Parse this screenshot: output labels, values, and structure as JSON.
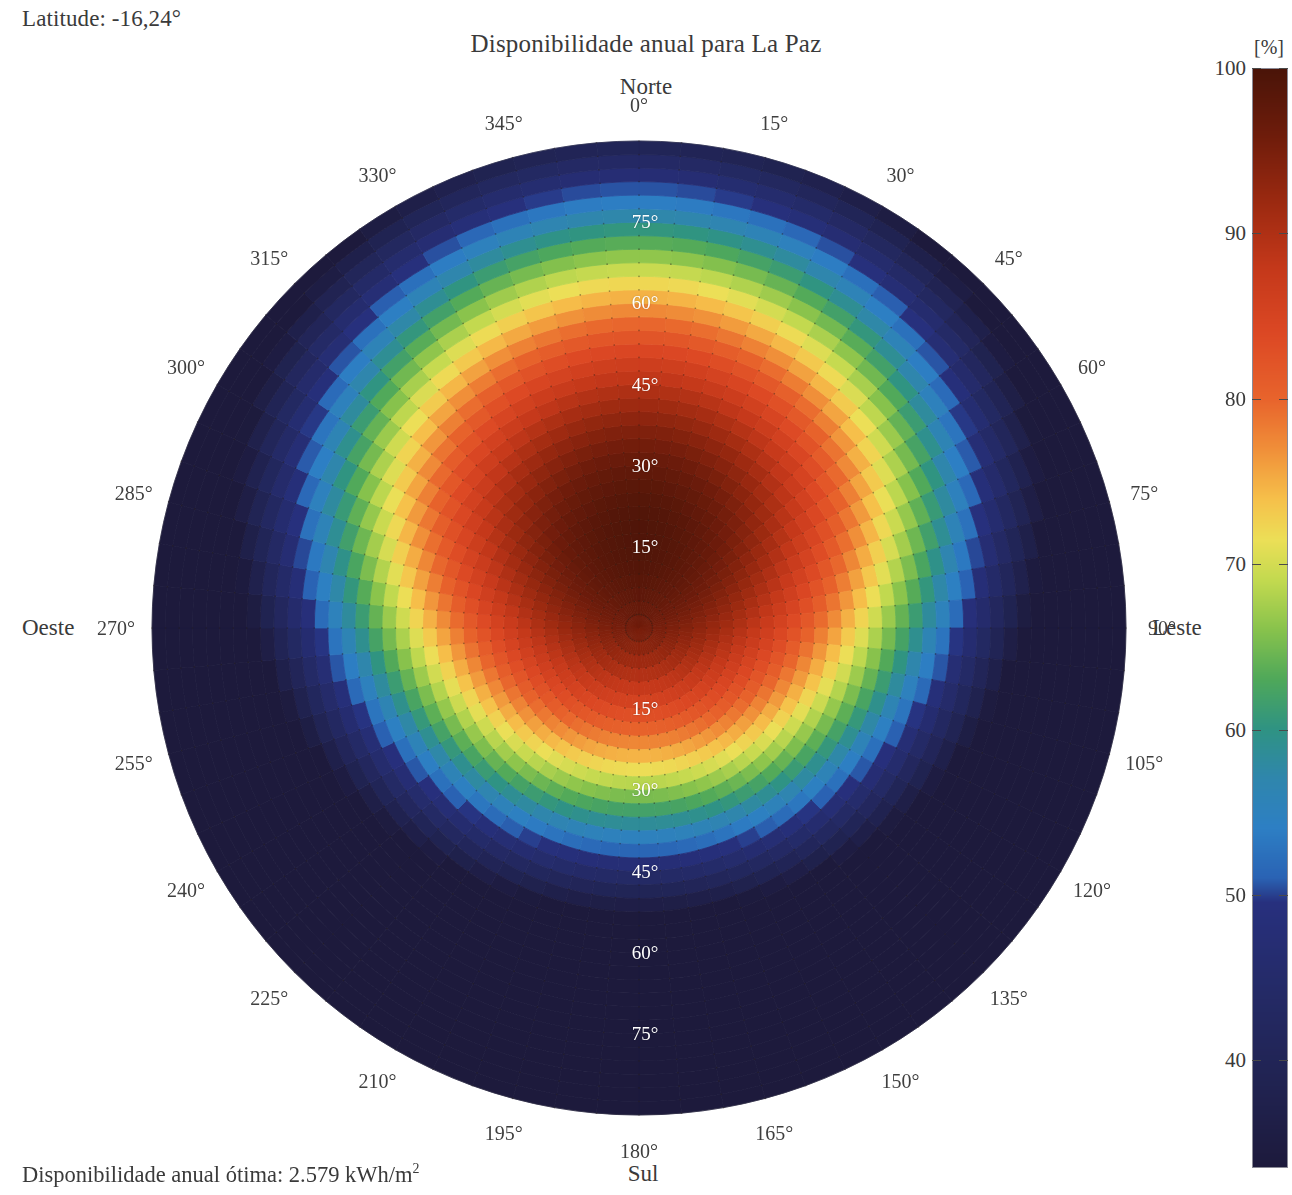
{
  "header": {
    "latitude_label": "Latitude: -16,24°",
    "title": "Disponibilidade anual para La Paz"
  },
  "footer": {
    "note_prefix": "Disponibilidade anual ótima: 2.579 kWh/m",
    "note_exponent": "2"
  },
  "cardinals": {
    "north": "Norte",
    "south": "Sul",
    "west": "Oeste",
    "east": "Leste"
  },
  "colorbar": {
    "unit": "[%]",
    "ticks": [
      100,
      90,
      80,
      70,
      60,
      50,
      40
    ],
    "vmax": 100,
    "vmin": 33.5,
    "stops": [
      {
        "v": 100.0,
        "color": "#4a1408"
      },
      {
        "v": 96.0,
        "color": "#6e1c0b"
      },
      {
        "v": 92.0,
        "color": "#9b2910"
      },
      {
        "v": 88.0,
        "color": "#c4381a"
      },
      {
        "v": 84.0,
        "color": "#dc4824"
      },
      {
        "v": 80.0,
        "color": "#e8642c"
      },
      {
        "v": 77.0,
        "color": "#f08f39"
      },
      {
        "v": 74.0,
        "color": "#f6c04a"
      },
      {
        "v": 71.5,
        "color": "#ecdf57"
      },
      {
        "v": 69.0,
        "color": "#c2d94f"
      },
      {
        "v": 66.0,
        "color": "#87c24c"
      },
      {
        "v": 63.0,
        "color": "#4fa85a"
      },
      {
        "v": 60.0,
        "color": "#2f9383"
      },
      {
        "v": 57.0,
        "color": "#2f86ad"
      },
      {
        "v": 54.0,
        "color": "#2d7fc4"
      },
      {
        "v": 51.0,
        "color": "#2a63b4"
      },
      {
        "v": 49.5,
        "color": "#27307e"
      },
      {
        "v": 44.0,
        "color": "#242a66"
      },
      {
        "v": 38.0,
        "color": "#20224f"
      },
      {
        "v": 33.5,
        "color": "#1d1a3c"
      }
    ]
  },
  "polar": {
    "center_x": 639,
    "center_y": 628,
    "radius": 487,
    "azimuth_labels": [
      "0°",
      "15°",
      "30°",
      "45°",
      "60°",
      "75°",
      "90°",
      "105°",
      "120°",
      "135°",
      "150°",
      "165°",
      "180°",
      "195°",
      "210°",
      "225°",
      "240°",
      "255°",
      "270°",
      "285°",
      "300°",
      "315°",
      "330°",
      "345°"
    ],
    "azimuth_values": [
      0,
      15,
      30,
      45,
      60,
      75,
      90,
      105,
      120,
      135,
      150,
      165,
      180,
      195,
      210,
      225,
      240,
      255,
      270,
      285,
      300,
      315,
      330,
      345
    ],
    "tilt_rings": [
      15,
      30,
      45,
      60,
      75
    ],
    "tilt_labels_north": [
      "15°",
      "30°",
      "45°",
      "60°",
      "75°"
    ],
    "tilt_labels_south": [
      "15°",
      "30°",
      "45°",
      "60°",
      "75°"
    ],
    "tilt_max": 90,
    "n_azimuth_cells": 72,
    "n_tilt_cells": 36
  },
  "chart_data": {
    "type": "heatmap",
    "projection": "polar",
    "title": "Disponibilidade anual para La Paz",
    "subtitle": "Latitude: -16,24°",
    "annotation": "Disponibilidade anual ótima: 2.579 kWh/m2",
    "xlabel": "Azimute [°]  (0° = Norte, 90° = Leste, 180° = Sul, 270° = Oeste)",
    "ylabel": "Inclinação [°]  (0° no centro, 90° na borda)",
    "zlabel": "Disponibilidade anual [%]",
    "zlim": [
      33.5,
      100
    ],
    "grid": true,
    "legend": "colorbar-right",
    "radial_ticks": [
      15,
      30,
      45,
      60,
      75
    ],
    "angular_ticks": [
      0,
      15,
      30,
      45,
      60,
      75,
      90,
      105,
      120,
      135,
      150,
      165,
      180,
      195,
      210,
      225,
      240,
      255,
      270,
      285,
      300,
      315,
      330,
      345
    ],
    "optimum": {
      "azimuth_deg": 0,
      "tilt_deg": 20,
      "value_pct": 100,
      "annual_kwh_per_m2": 2579
    },
    "model": {
      "description": "Availability (%) of the optimum annual irradiation as a function of surface azimuth and tilt; peak 100% around north-facing, tilt ~20 deg (southern hemisphere, latitude -16.24 deg).",
      "peak_tilt_deg": 20,
      "peak_azimuth_deg": 0,
      "value_at_horizontal_pct": 95,
      "value_at_tilt90_north_pct": 58,
      "value_at_tilt90_south_pct": 34,
      "value_at_tilt90_east_west_pct": 52
    },
    "samples": [
      {
        "azimuth_deg": 0,
        "tilt_deg": 0,
        "value_pct": 95.0
      },
      {
        "azimuth_deg": 0,
        "tilt_deg": 15,
        "value_pct": 99.6
      },
      {
        "azimuth_deg": 0,
        "tilt_deg": 20,
        "value_pct": 100.0
      },
      {
        "azimuth_deg": 0,
        "tilt_deg": 30,
        "value_pct": 98.6
      },
      {
        "azimuth_deg": 0,
        "tilt_deg": 45,
        "value_pct": 91.0
      },
      {
        "azimuth_deg": 0,
        "tilt_deg": 60,
        "value_pct": 80.0
      },
      {
        "azimuth_deg": 0,
        "tilt_deg": 75,
        "value_pct": 68.0
      },
      {
        "azimuth_deg": 0,
        "tilt_deg": 90,
        "value_pct": 58.0
      },
      {
        "azimuth_deg": 90,
        "tilt_deg": 15,
        "value_pct": 95.5
      },
      {
        "azimuth_deg": 90,
        "tilt_deg": 30,
        "value_pct": 89.0
      },
      {
        "azimuth_deg": 90,
        "tilt_deg": 45,
        "value_pct": 79.0
      },
      {
        "azimuth_deg": 90,
        "tilt_deg": 60,
        "value_pct": 68.0
      },
      {
        "azimuth_deg": 90,
        "tilt_deg": 75,
        "value_pct": 59.0
      },
      {
        "azimuth_deg": 90,
        "tilt_deg": 90,
        "value_pct": 52.0
      },
      {
        "azimuth_deg": 180,
        "tilt_deg": 15,
        "value_pct": 89.0
      },
      {
        "azimuth_deg": 180,
        "tilt_deg": 30,
        "value_pct": 76.0
      },
      {
        "azimuth_deg": 180,
        "tilt_deg": 45,
        "value_pct": 62.0
      },
      {
        "azimuth_deg": 180,
        "tilt_deg": 60,
        "value_pct": 49.0
      },
      {
        "azimuth_deg": 180,
        "tilt_deg": 75,
        "value_pct": 39.0
      },
      {
        "azimuth_deg": 180,
        "tilt_deg": 90,
        "value_pct": 34.0
      },
      {
        "azimuth_deg": 270,
        "tilt_deg": 15,
        "value_pct": 95.5
      },
      {
        "azimuth_deg": 270,
        "tilt_deg": 30,
        "value_pct": 89.0
      },
      {
        "azimuth_deg": 270,
        "tilt_deg": 45,
        "value_pct": 79.0
      },
      {
        "azimuth_deg": 270,
        "tilt_deg": 60,
        "value_pct": 68.0
      },
      {
        "azimuth_deg": 270,
        "tilt_deg": 75,
        "value_pct": 59.0
      },
      {
        "azimuth_deg": 270,
        "tilt_deg": 90,
        "value_pct": 52.0
      }
    ]
  }
}
